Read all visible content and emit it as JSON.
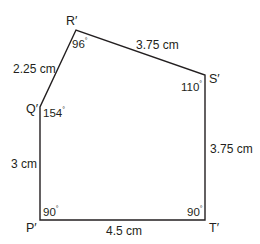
{
  "diagram": {
    "type": "pentagon",
    "stroke_color": "#231f20",
    "background": "#ffffff",
    "vertices": [
      {
        "id": "P",
        "label": "P′",
        "x": 40,
        "y": 220,
        "angle": "90",
        "angle_symbol": "°"
      },
      {
        "id": "Q",
        "label": "Q′",
        "x": 40,
        "y": 107,
        "angle": "154",
        "angle_symbol": "°"
      },
      {
        "id": "R",
        "label": "R′",
        "x": 76,
        "y": 30,
        "angle": "96",
        "angle_symbol": "°"
      },
      {
        "id": "S",
        "label": "S′",
        "x": 205,
        "y": 75,
        "angle": "110",
        "angle_symbol": "°"
      },
      {
        "id": "T",
        "label": "T′",
        "x": 205,
        "y": 220,
        "angle": "90",
        "angle_symbol": "°"
      }
    ],
    "sides": [
      {
        "from": "P",
        "to": "Q",
        "length": "3 cm"
      },
      {
        "from": "Q",
        "to": "R",
        "length": "2.25 cm"
      },
      {
        "from": "R",
        "to": "S",
        "length": "3.75 cm"
      },
      {
        "from": "S",
        "to": "T",
        "length": "3.75 cm"
      },
      {
        "from": "T",
        "to": "P",
        "length": "4.5 cm"
      }
    ]
  }
}
